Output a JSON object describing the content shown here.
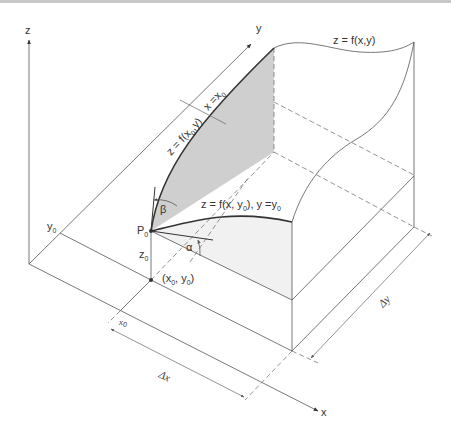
{
  "diagram": {
    "type": "3d-surface-partial-derivatives",
    "axes": {
      "x_label": "x",
      "y_label": "y",
      "z_label": "z"
    },
    "surface_label": "z = f(x,y)",
    "curve_x0": {
      "main": "z = f(x",
      "sub": "0",
      "after": ",y)",
      "condition_main": "x =x",
      "condition_sub": "0"
    },
    "curve_y0": {
      "main": "z = f(x, y",
      "sub": "0",
      "after": "), y =y",
      "condition_sub": "0"
    },
    "point_P0": {
      "main": "P",
      "sub": "0"
    },
    "height_z0": {
      "main": "z",
      "sub": "0"
    },
    "ground_point": {
      "open": "(x",
      "sub1": "0",
      "mid": ", y",
      "sub2": "0",
      "close": ")"
    },
    "y0_tick": {
      "main": "y",
      "sub": "0"
    },
    "x0_tick": {
      "main": "x",
      "sub": "0"
    },
    "angle_alpha": "α",
    "angle_beta": "β",
    "delta_x": "Δx",
    "delta_y": "Δy",
    "colors": {
      "line": "#555555",
      "shade_x0_slice": "#cfcfcf",
      "shade_y0_slice": "#f1f1f1",
      "curve": "#333333"
    }
  }
}
